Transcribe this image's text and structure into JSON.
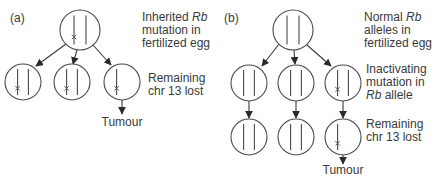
{
  "figure": {
    "panels": [
      {
        "id": "a",
        "label": "(a)",
        "label_pos": [
          10,
          22
        ],
        "annotations": [
          {
            "lines": [
              [
                {
                  "t": "Inherited "
                },
                {
                  "t": "Rb",
                  "i": true
                }
              ],
              [
                {
                  "t": "mutation in"
                }
              ],
              [
                {
                  "t": "fertilized egg"
                }
              ]
            ],
            "x": 142,
            "y": 21
          },
          {
            "lines": [
              [
                {
                  "t": "Remaining"
                }
              ],
              [
                {
                  "t": "chr 13 lost"
                }
              ]
            ],
            "x": 148,
            "y": 82
          }
        ],
        "cells": [
          {
            "id": "a-egg",
            "cx": 80,
            "cy": 30,
            "r": 20,
            "mutated": true
          },
          {
            "id": "a-1",
            "cx": 23,
            "cy": 82,
            "r": 18,
            "mutated": true
          },
          {
            "id": "a-2",
            "cx": 72,
            "cy": 82,
            "r": 18,
            "mutated": true
          },
          {
            "id": "a-3",
            "cx": 122,
            "cy": 82,
            "r": 18,
            "mutated": true,
            "single": true
          }
        ],
        "edges": [
          {
            "from": [
              66,
              44
            ],
            "to": [
              36,
              66
            ]
          },
          {
            "from": [
              77,
              50
            ],
            "to": [
              73,
              64
            ]
          },
          {
            "from": [
              93,
              45
            ],
            "to": [
              111,
              65
            ]
          },
          {
            "from": [
              122,
              100
            ],
            "to": [
              122,
              114
            ]
          }
        ],
        "tumour": {
          "label": "Tumour",
          "x": 122,
          "y": 126
        }
      },
      {
        "id": "b",
        "label": "(b)",
        "label_pos": [
          224,
          22
        ],
        "annotations": [
          {
            "lines": [
              [
                {
                  "t": "Normal "
                },
                {
                  "t": "Rb",
                  "i": true
                }
              ],
              [
                {
                  "t": "alleles in"
                }
              ],
              [
                {
                  "t": "fertilized egg"
                }
              ]
            ],
            "x": 364,
            "y": 21
          },
          {
            "lines": [
              [
                {
                  "t": "Inactivating"
                }
              ],
              [
                {
                  "t": "mutation in"
                }
              ],
              [
                {
                  "t": "Rb",
                  "i": true
                },
                {
                  "t": " allele"
                }
              ]
            ],
            "x": 366,
            "y": 73
          },
          {
            "lines": [
              [
                {
                  "t": "Remaining"
                }
              ],
              [
                {
                  "t": "chr 13 lost"
                }
              ]
            ],
            "x": 366,
            "y": 128
          }
        ],
        "cells": [
          {
            "id": "b-egg",
            "cx": 293,
            "cy": 30,
            "r": 20,
            "mutated": false
          },
          {
            "id": "b-1",
            "cx": 249,
            "cy": 83,
            "r": 18,
            "mutated": false
          },
          {
            "id": "b-2",
            "cx": 296,
            "cy": 83,
            "r": 18,
            "mutated": false
          },
          {
            "id": "b-3",
            "cx": 343,
            "cy": 83,
            "r": 18,
            "mutated": true
          },
          {
            "id": "b-4",
            "cx": 249,
            "cy": 137,
            "r": 18,
            "mutated": false
          },
          {
            "id": "b-5",
            "cx": 296,
            "cy": 137,
            "r": 18,
            "mutated": false
          },
          {
            "id": "b-6",
            "cx": 343,
            "cy": 137,
            "r": 18,
            "mutated": true,
            "single": true
          }
        ],
        "edges": [
          {
            "from": [
              279,
              44
            ],
            "to": [
              262,
              66
            ]
          },
          {
            "from": [
              294,
              50
            ],
            "to": [
              295,
              64
            ]
          },
          {
            "from": [
              307,
              45
            ],
            "to": [
              331,
              66
            ]
          },
          {
            "from": [
              249,
              101
            ],
            "to": [
              249,
              118
            ]
          },
          {
            "from": [
              296,
              101
            ],
            "to": [
              296,
              118
            ]
          },
          {
            "from": [
              343,
              101
            ],
            "to": [
              343,
              118
            ]
          },
          {
            "from": [
              343,
              155
            ],
            "to": [
              343,
              164
            ]
          }
        ],
        "tumour": {
          "label": "Tumour",
          "x": 343,
          "y": 174
        }
      }
    ]
  }
}
